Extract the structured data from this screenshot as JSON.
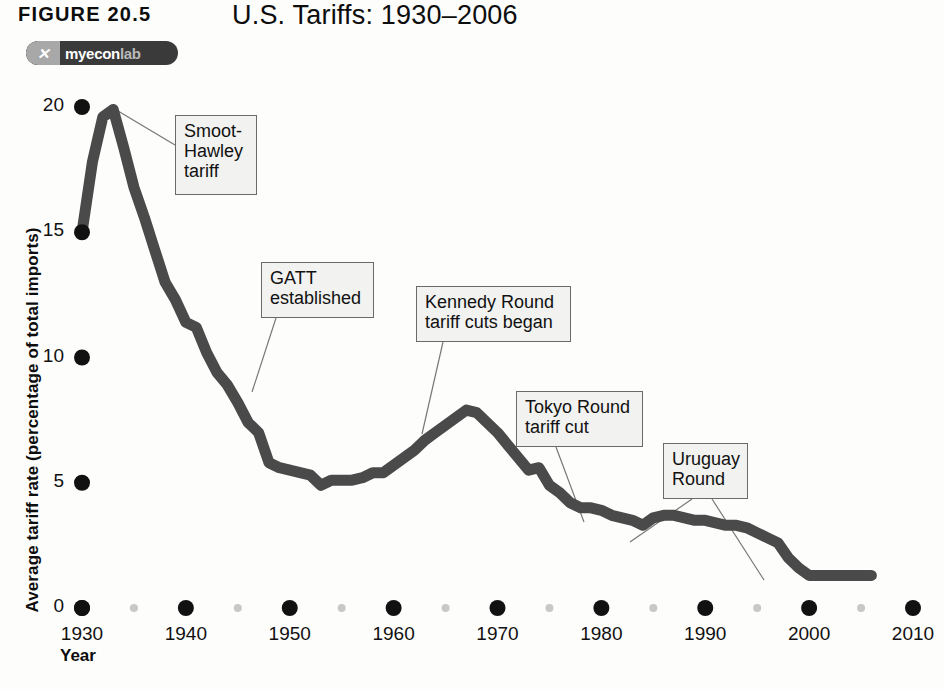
{
  "header": {
    "figure_label": "FIGURE 20.5",
    "title": "U.S. Tariffs: 1930–2006",
    "logo": {
      "mark": "✕",
      "part1": "my",
      "part2": "econ",
      "part3": "lab"
    }
  },
  "chart_data": {
    "type": "line",
    "title": "U.S. Tariffs: 1930–2006",
    "xlabel": "Year",
    "ylabel": "Average tariff rate (percentage of total imports)",
    "xlim": [
      1930,
      2010
    ],
    "ylim": [
      0,
      20
    ],
    "xticks": [
      1930,
      1940,
      1950,
      1960,
      1970,
      1980,
      1990,
      2000,
      2010
    ],
    "xtick_labels": [
      "1930",
      "1940",
      "1950",
      "1960",
      "1970",
      "1980",
      "1990",
      "2000",
      "2010"
    ],
    "xminor_ticks": [
      1935,
      1945,
      1955,
      1965,
      1975,
      1985,
      1995,
      2005
    ],
    "yticks": [
      0,
      5,
      10,
      15,
      20
    ],
    "ytick_labels": [
      "0",
      "5",
      "10",
      "15",
      "20"
    ],
    "grid": false,
    "legend": "none",
    "line_color": "#4a4a4a",
    "tick_color": "#111111",
    "minor_tick_color": "#c8c8c8",
    "series": [
      {
        "name": "Average U.S. tariff rate",
        "x": [
          1930,
          1931,
          1932,
          1933,
          1934,
          1935,
          1936,
          1937,
          1938,
          1939,
          1940,
          1941,
          1942,
          1943,
          1944,
          1945,
          1946,
          1947,
          1948,
          1949,
          1950,
          1951,
          1952,
          1953,
          1954,
          1955,
          1956,
          1957,
          1958,
          1959,
          1960,
          1961,
          1962,
          1963,
          1964,
          1965,
          1966,
          1967,
          1968,
          1969,
          1970,
          1971,
          1972,
          1973,
          1974,
          1975,
          1976,
          1977,
          1978,
          1979,
          1980,
          1981,
          1982,
          1983,
          1984,
          1985,
          1986,
          1987,
          1988,
          1989,
          1990,
          1991,
          1992,
          1993,
          1994,
          1995,
          1996,
          1997,
          1998,
          1999,
          2000,
          2001,
          2002,
          2003,
          2004,
          2005,
          2006
        ],
        "y": [
          15.0,
          17.8,
          19.6,
          19.9,
          18.4,
          16.8,
          15.6,
          14.3,
          13.0,
          12.3,
          11.4,
          11.2,
          10.2,
          9.4,
          8.9,
          8.2,
          7.4,
          7.0,
          5.8,
          5.6,
          5.5,
          5.4,
          5.3,
          4.9,
          5.1,
          5.1,
          5.1,
          5.2,
          5.4,
          5.4,
          5.7,
          6.0,
          6.3,
          6.7,
          7.0,
          7.3,
          7.6,
          7.9,
          7.8,
          7.4,
          7.0,
          6.5,
          6.0,
          5.5,
          5.6,
          4.9,
          4.6,
          4.2,
          4.0,
          4.0,
          3.9,
          3.7,
          3.6,
          3.5,
          3.3,
          3.6,
          3.7,
          3.7,
          3.6,
          3.5,
          3.5,
          3.4,
          3.3,
          3.3,
          3.2,
          3.0,
          2.8,
          2.6,
          2.0,
          1.6,
          1.3,
          1.3,
          1.3,
          1.3,
          1.3,
          1.3,
          1.3
        ]
      }
    ],
    "annotations": [
      {
        "id": "smoot-hawley",
        "text": "Smoot-\nHawley\ntariff",
        "box": {
          "x": 175,
          "y": 35,
          "w": 82,
          "h": 80
        },
        "leader": [
          {
            "from": [
              175,
              65
            ],
            "to": [
              113,
              28
            ]
          }
        ]
      },
      {
        "id": "gatt",
        "text": "GATT\nestablished",
        "box": {
          "x": 261,
          "y": 182,
          "w": 113,
          "h": 56
        },
        "leader": [
          {
            "from": [
              276,
              238
            ],
            "to": [
              252,
              312
            ]
          }
        ]
      },
      {
        "id": "kennedy",
        "text": "Kennedy Round\ntariff cuts began",
        "box": {
          "x": 416,
          "y": 206,
          "w": 155,
          "h": 56
        },
        "leader": [
          {
            "from": [
              443,
              262
            ],
            "to": [
              422,
              354
            ]
          }
        ]
      },
      {
        "id": "tokyo",
        "text": "Tokyo Round\ntariff cut",
        "box": {
          "x": 516,
          "y": 311,
          "w": 127,
          "h": 56
        },
        "leader": [
          {
            "from": [
              556,
              367
            ],
            "to": [
              584,
              442
            ]
          }
        ]
      },
      {
        "id": "uruguay",
        "text": "Uruguay\nRound",
        "box": {
          "x": 663,
          "y": 363,
          "w": 85,
          "h": 56
        },
        "leader": [
          {
            "from": [
              692,
              419
            ],
            "to": [
              630,
              462
            ]
          },
          {
            "from": [
              712,
              419
            ],
            "to": [
              764,
              500
            ]
          }
        ]
      }
    ]
  }
}
